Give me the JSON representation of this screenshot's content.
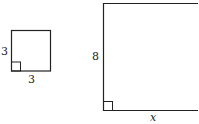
{
  "diagram": {
    "small_square": {
      "side_label_left": "3",
      "side_label_bottom": "3",
      "right_angle_marker": true
    },
    "large_rectangle": {
      "side_label_left": "8",
      "side_label_bottom": "x",
      "right_angle_marker": true
    },
    "stroke_color": "#222222"
  }
}
